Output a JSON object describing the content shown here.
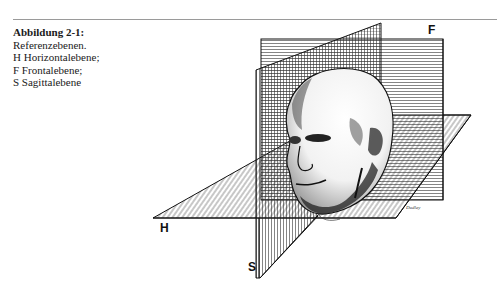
{
  "caption": {
    "title": "Abbildung 2-1:",
    "lines": [
      "Referenzebenen.",
      "H Horizontalebene;",
      "F Frontalebene;",
      "S Sagittalebene"
    ]
  },
  "figure": {
    "planes": {
      "frontal": {
        "label": "F",
        "name": "Frontalebene"
      },
      "horizontal": {
        "label": "H",
        "name": "Horizontalebene"
      },
      "sagittal": {
        "label": "S",
        "name": "Sagittalebene"
      }
    },
    "signature": "Dudley"
  }
}
